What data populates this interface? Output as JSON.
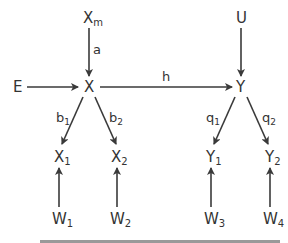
{
  "diagram": {
    "type": "path-diagram",
    "colors": {
      "stroke": "#3a3a3a",
      "text": "#333333",
      "background": "#ffffff"
    },
    "nodes": {
      "Xm": {
        "base": "X",
        "sub": "m"
      },
      "E": {
        "base": "E",
        "sub": ""
      },
      "X": {
        "base": "X",
        "sub": ""
      },
      "U": {
        "base": "U",
        "sub": ""
      },
      "Y": {
        "base": "Y",
        "sub": ""
      },
      "X1": {
        "base": "X",
        "sub": "1"
      },
      "X2": {
        "base": "X",
        "sub": "2"
      },
      "Y1": {
        "base": "Y",
        "sub": "1"
      },
      "Y2": {
        "base": "Y",
        "sub": "2"
      },
      "W1": {
        "base": "W",
        "sub": "1"
      },
      "W2": {
        "base": "W",
        "sub": "2"
      },
      "W3": {
        "base": "W",
        "sub": "3"
      },
      "W4": {
        "base": "W",
        "sub": "4"
      }
    },
    "edges": {
      "a": {
        "base": "a",
        "sub": "",
        "from": "Xm",
        "to": "X"
      },
      "h": {
        "base": "h",
        "sub": "",
        "from": "X",
        "to": "Y"
      },
      "b1": {
        "base": "b",
        "sub": "1",
        "from": "X",
        "to": "X1"
      },
      "b2": {
        "base": "b",
        "sub": "2",
        "from": "X",
        "to": "X2"
      },
      "q1": {
        "base": "q",
        "sub": "1",
        "from": "Y",
        "to": "Y1"
      },
      "q2": {
        "base": "q",
        "sub": "2",
        "from": "Y",
        "to": "Y2"
      },
      "e_E": {
        "from": "E",
        "to": "X"
      },
      "e_U": {
        "from": "U",
        "to": "Y"
      },
      "e_W1": {
        "from": "W1",
        "to": "X1"
      },
      "e_W2": {
        "from": "W2",
        "to": "X2"
      },
      "e_W3": {
        "from": "W3",
        "to": "Y1"
      },
      "e_W4": {
        "from": "W4",
        "to": "Y2"
      }
    }
  }
}
